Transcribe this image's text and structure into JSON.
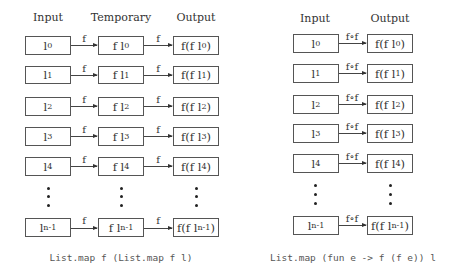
{
  "left": {
    "headers": {
      "input": "Input",
      "temporary": "Temporary",
      "output": "Output"
    },
    "arrow_label": "f",
    "rows": [
      {
        "input_base": "l",
        "sub": "0",
        "temp_base": "f l",
        "out_pre": "f(f l",
        "out_post": ")"
      },
      {
        "input_base": "l",
        "sub": "1",
        "temp_base": "f l",
        "out_pre": "f(f l",
        "out_post": ")"
      },
      {
        "input_base": "l",
        "sub": "2",
        "temp_base": "f l",
        "out_pre": "f(f l",
        "out_post": ")"
      },
      {
        "input_base": "l",
        "sub": "3",
        "temp_base": "f l",
        "out_pre": "f(f l",
        "out_post": ")"
      },
      {
        "input_base": "l",
        "sub": "4",
        "temp_base": "f l",
        "out_pre": "f(f l",
        "out_post": ")"
      },
      {
        "input_base": "l",
        "sub": "n-1",
        "temp_base": "f l",
        "out_pre": "f(f l",
        "out_post": ")"
      }
    ],
    "caption": "List.map f (List.map f l)"
  },
  "right": {
    "headers": {
      "input": "Input",
      "output": "Output"
    },
    "arrow_label": "f∘f",
    "rows": [
      {
        "input_base": "l",
        "sub": "0",
        "out_pre": "f(f l",
        "out_post": ")"
      },
      {
        "input_base": "l",
        "sub": "1",
        "out_pre": "f(f l",
        "out_post": ")"
      },
      {
        "input_base": "l",
        "sub": "2",
        "out_pre": "f(f l",
        "out_post": ")"
      },
      {
        "input_base": "l",
        "sub": "3",
        "out_pre": "f(f l",
        "out_post": ")"
      },
      {
        "input_base": "l",
        "sub": "4",
        "out_pre": "f(f l",
        "out_post": ")"
      },
      {
        "input_base": "l",
        "sub": "n-1",
        "out_pre": "f(f l",
        "out_post": ")"
      }
    ],
    "caption": "List.map (fun e -> f (f e)) l"
  }
}
